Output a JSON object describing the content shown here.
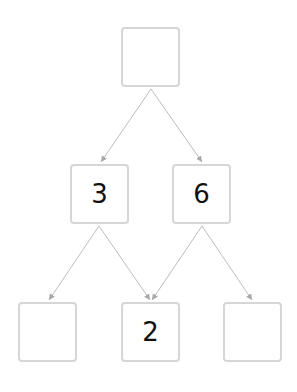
{
  "diagram": {
    "nodes": [
      {
        "id": "top",
        "value": "",
        "x": 121,
        "y": 27
      },
      {
        "id": "mid-left",
        "value": "3",
        "x": 70,
        "y": 164
      },
      {
        "id": "mid-right",
        "value": "6",
        "x": 172,
        "y": 164
      },
      {
        "id": "bottom-left",
        "value": "",
        "x": 18,
        "y": 302
      },
      {
        "id": "bottom-middle",
        "value": "2",
        "x": 121,
        "y": 302
      },
      {
        "id": "bottom-right",
        "value": "",
        "x": 223,
        "y": 302
      }
    ],
    "edges": [
      {
        "from": "top",
        "to": "mid-left"
      },
      {
        "from": "top",
        "to": "mid-right"
      },
      {
        "from": "mid-left",
        "to": "bottom-left"
      },
      {
        "from": "mid-left",
        "to": "bottom-middle"
      },
      {
        "from": "mid-right",
        "to": "bottom-middle"
      },
      {
        "from": "mid-right",
        "to": "bottom-right"
      }
    ],
    "colors": {
      "border": "#d6d6d6",
      "edge": "#b0b0b0",
      "text": "#111111"
    }
  }
}
